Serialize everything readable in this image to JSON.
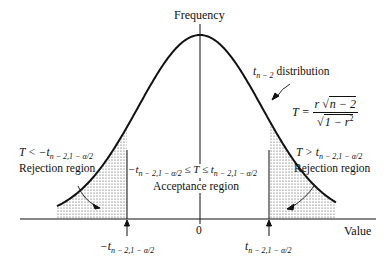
{
  "axis": {
    "y_label": "Frequency",
    "x_label": "Value",
    "origin_tick": "0"
  },
  "curve": {
    "name_var": "t",
    "name_sub": "n − 2",
    "name_text": "distribution"
  },
  "statistic": {
    "lhs": "T =",
    "num_r": "r",
    "num_sqrt": "n − 2",
    "den_sqrt": "1 − r",
    "den_sup": "2"
  },
  "left_region": {
    "condition_lhs": "T <",
    "condition_rhs": "−t",
    "condition_sub": "n − 2,1 − α/2",
    "label": "Rejection region"
  },
  "right_region": {
    "condition_lhs": "T >",
    "condition_rhs": "t",
    "condition_sub": "n − 2,1 − α/2",
    "label": "Rejection region"
  },
  "acceptance": {
    "left": "−t",
    "left_sub": "n − 2,1 − α/2",
    "middle": "≤ T ≤",
    "right": "t",
    "right_sub": "n − 2,1 − α/2",
    "label": "Acceptance region"
  },
  "critical_values": {
    "left": "−t",
    "left_sub": "n − 2,1 − α/2",
    "right": "t",
    "right_sub": "n − 2,1 − α/2"
  }
}
